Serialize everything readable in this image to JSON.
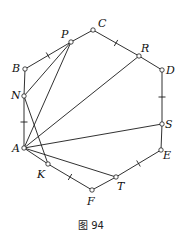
{
  "figure": {
    "caption": "图 94",
    "points": [
      {
        "name": "A",
        "x": 24,
        "y": 148,
        "lx": 12,
        "ly": 152
      },
      {
        "name": "B",
        "x": 25,
        "y": 69,
        "lx": 12,
        "ly": 72
      },
      {
        "name": "C",
        "x": 93,
        "y": 30,
        "lx": 98,
        "ly": 27
      },
      {
        "name": "D",
        "x": 162,
        "y": 70,
        "lx": 166,
        "ly": 74
      },
      {
        "name": "E",
        "x": 161,
        "y": 150,
        "lx": 163,
        "ly": 159
      },
      {
        "name": "F",
        "x": 92,
        "y": 190,
        "lx": 87,
        "ly": 205
      },
      {
        "name": "P",
        "x": 71,
        "y": 42,
        "lx": 61,
        "ly": 38
      },
      {
        "name": "R",
        "x": 139,
        "y": 56,
        "lx": 141,
        "ly": 52
      },
      {
        "name": "N",
        "x": 24,
        "y": 96,
        "lx": 11,
        "ly": 99
      },
      {
        "name": "S",
        "x": 162,
        "y": 124,
        "lx": 165,
        "ly": 128
      },
      {
        "name": "K",
        "x": 48,
        "y": 164,
        "lx": 37,
        "ly": 178
      },
      {
        "name": "T",
        "x": 116,
        "y": 177,
        "lx": 117,
        "ly": 190
      }
    ],
    "segments": [
      [
        "A",
        "N"
      ],
      [
        "N",
        "B"
      ],
      [
        "B",
        "P"
      ],
      [
        "P",
        "C"
      ],
      [
        "C",
        "R"
      ],
      [
        "R",
        "D"
      ],
      [
        "D",
        "S"
      ],
      [
        "S",
        "E"
      ],
      [
        "E",
        "T"
      ],
      [
        "T",
        "F"
      ],
      [
        "F",
        "K"
      ],
      [
        "K",
        "A"
      ],
      [
        "A",
        "P"
      ],
      [
        "N",
        "P"
      ],
      [
        "N",
        "K"
      ],
      [
        "A",
        "R"
      ],
      [
        "A",
        "S"
      ],
      [
        "A",
        "T"
      ]
    ],
    "ticks": [
      [
        "B",
        "P"
      ],
      [
        "C",
        "R"
      ],
      [
        "A",
        "N"
      ],
      [
        "K",
        "F"
      ],
      [
        "T",
        "E"
      ],
      [
        "D",
        "S"
      ]
    ]
  }
}
